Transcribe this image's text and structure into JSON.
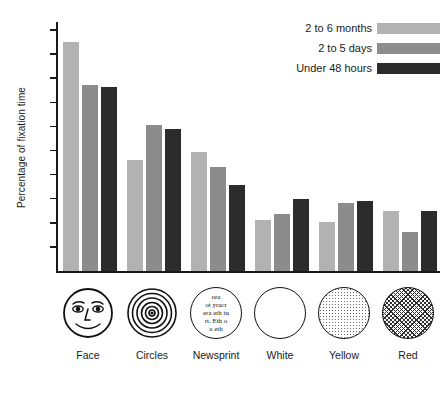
{
  "chart_data": {
    "type": "bar",
    "title": "",
    "xlabel": "",
    "ylabel": "Percentage of fixation time",
    "categories": [
      "Face",
      "Circles",
      "Newsprint",
      "White",
      "Yellow",
      "Red"
    ],
    "series": [
      {
        "name": "2 to 6 months",
        "color": "#b2b2b2",
        "values": [
          34.0,
          18.4,
          19.8,
          8.5,
          8.1,
          9.9
        ]
      },
      {
        "name": "2 to 5 days",
        "color": "#8c8c8c",
        "values": [
          29.4,
          24.3,
          17.3,
          9.5,
          11.3,
          6.5
        ]
      },
      {
        "name": "Under 48 hours",
        "color": "#2c2c2c",
        "values": [
          29.3,
          23.6,
          14.2,
          12.0,
          11.6,
          10.0
        ]
      }
    ],
    "yticks": [
      36,
      32,
      30,
      28,
      24,
      20,
      16,
      12,
      8,
      4
    ],
    "ylim": [
      0,
      38
    ],
    "grid": false,
    "legend_position": "top-right"
  },
  "legend": {
    "items": [
      {
        "label": "2 to 6 months",
        "color": "#b2b2b2"
      },
      {
        "label": "2 to 5 days",
        "color": "#8c8c8c"
      },
      {
        "label": "Under 48 hours",
        "color": "#2c2c2c"
      }
    ]
  },
  "stimuli": [
    {
      "label": "Face",
      "icon": "face-circle-icon"
    },
    {
      "label": "Circles",
      "icon": "concentric-circles-icon"
    },
    {
      "label": "Newsprint",
      "icon": "newsprint-circle-icon"
    },
    {
      "label": "White",
      "icon": "white-circle-icon"
    },
    {
      "label": "Yellow",
      "icon": "yellow-stipple-circle-icon"
    },
    {
      "label": "Red",
      "icon": "red-crosshatch-circle-icon"
    }
  ],
  "newsprint_text": [
    "rea",
    "ot yracr",
    "era eth tu",
    "rt. Eth o",
    "a eth"
  ]
}
